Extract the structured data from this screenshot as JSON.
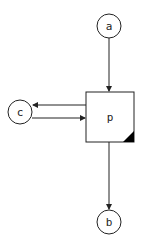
{
  "diagram": {
    "nodes": [
      {
        "id": "a",
        "label": "a",
        "shape": "circle"
      },
      {
        "id": "c",
        "label": "c",
        "shape": "circle"
      },
      {
        "id": "p",
        "label": "p",
        "shape": "box",
        "corner_marker": "filled-triangle-bottom-right"
      },
      {
        "id": "b",
        "label": "b",
        "shape": "circle"
      }
    ],
    "edges": [
      {
        "from": "a",
        "to": "p"
      },
      {
        "from": "p",
        "to": "c"
      },
      {
        "from": "c",
        "to": "p"
      },
      {
        "from": "p",
        "to": "b"
      }
    ],
    "colors": {
      "stroke": "#222222",
      "fill": "#ffffff",
      "marker": "#000000"
    }
  }
}
